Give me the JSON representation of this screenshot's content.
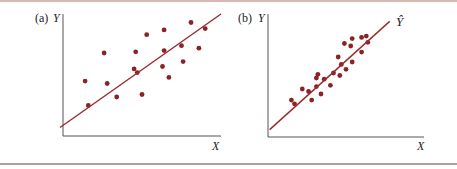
{
  "panels": [
    {
      "tag": "(a)",
      "y_label": "Y",
      "x_label": "X",
      "line_label": ""
    },
    {
      "tag": "(b)",
      "y_label": "Y",
      "x_label": "X",
      "line_label": "Ŷ",
      "line_label_hat": "^"
    }
  ],
  "colors": {
    "points": "#8b2226",
    "line": "#9b2a2e",
    "axes": "#555555",
    "rule": "#c9a8a4"
  },
  "chart_data": [
    {
      "type": "scatter",
      "title": "(a)",
      "xlabel": "X",
      "ylabel": "Y",
      "note": "Weak positive linear relationship; points widely scattered around fitted regression line",
      "grid": false,
      "regression_line": {
        "x": [
          0,
          1
        ],
        "y": [
          0.07,
          1.0
        ]
      },
      "points": [
        [
          0.14,
          0.45
        ],
        [
          0.16,
          0.25
        ],
        [
          0.26,
          0.68
        ],
        [
          0.28,
          0.43
        ],
        [
          0.34,
          0.32
        ],
        [
          0.46,
          0.69
        ],
        [
          0.45,
          0.55
        ],
        [
          0.47,
          0.52
        ],
        [
          0.5,
          0.34
        ],
        [
          0.53,
          0.83
        ],
        [
          0.64,
          0.87
        ],
        [
          0.64,
          0.7
        ],
        [
          0.63,
          0.57
        ],
        [
          0.67,
          0.48
        ],
        [
          0.75,
          0.74
        ],
        [
          0.76,
          0.61
        ],
        [
          0.81,
          0.93
        ],
        [
          0.86,
          0.72
        ],
        [
          0.9,
          0.88
        ]
      ]
    },
    {
      "type": "scatter",
      "title": "(b)",
      "xlabel": "X",
      "ylabel": "Y",
      "line_label": "Ŷ",
      "note": "Strong positive linear relationship; points tightly clustered around fitted regression line",
      "grid": false,
      "regression_line": {
        "x": [
          0.03,
          0.78
        ],
        "y": [
          0.06,
          0.94
        ]
      },
      "points": [
        [
          0.15,
          0.3
        ],
        [
          0.17,
          0.27
        ],
        [
          0.22,
          0.39
        ],
        [
          0.26,
          0.37
        ],
        [
          0.28,
          0.3
        ],
        [
          0.31,
          0.41
        ],
        [
          0.31,
          0.48
        ],
        [
          0.32,
          0.51
        ],
        [
          0.34,
          0.35
        ],
        [
          0.36,
          0.47
        ],
        [
          0.4,
          0.42
        ],
        [
          0.42,
          0.52
        ],
        [
          0.46,
          0.5
        ],
        [
          0.45,
          0.65
        ],
        [
          0.47,
          0.59
        ],
        [
          0.5,
          0.55
        ],
        [
          0.49,
          0.76
        ],
        [
          0.53,
          0.74
        ],
        [
          0.54,
          0.8
        ],
        [
          0.54,
          0.61
        ],
        [
          0.6,
          0.81
        ],
        [
          0.63,
          0.82
        ],
        [
          0.6,
          0.69
        ],
        [
          0.64,
          0.77
        ]
      ]
    }
  ]
}
